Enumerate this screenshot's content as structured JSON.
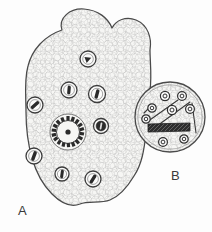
{
  "figure": {
    "background_color": "#fdfdfd",
    "ink_color": "#4a4a4a",
    "dark_ink_color": "#2b2b2b",
    "fill_color": "#f7f7f5",
    "panels": [
      {
        "id": "A",
        "label": "A",
        "label_x": 18,
        "label_y": 215,
        "shape": "lobed-oval-cross-section",
        "description": "Large lobed transverse section with parenchyma ground tissue, scattered vascular bundles and a central gear-like bundle",
        "center_bundle": {
          "name": "central-vascular-bundle",
          "cx": 68,
          "cy": 132,
          "r": 18,
          "teeth": 18,
          "core_r": 3
        },
        "bundles": [
          {
            "cx": 88,
            "cy": 59,
            "r": 8.0,
            "angle": -20,
            "kind": "wedge"
          },
          {
            "cx": 69,
            "cy": 90,
            "r": 8.0,
            "angle": 85,
            "kind": "slit"
          },
          {
            "cx": 97,
            "cy": 94,
            "r": 8.5,
            "angle": 75,
            "kind": "slit"
          },
          {
            "cx": 35,
            "cy": 105,
            "r": 8.0,
            "angle": 40,
            "kind": "slit"
          },
          {
            "cx": 101,
            "cy": 126,
            "r": 7.5,
            "angle": 95,
            "kind": "filled"
          },
          {
            "cx": 34,
            "cy": 156,
            "r": 8.0,
            "angle": 110,
            "kind": "slit"
          },
          {
            "cx": 62,
            "cy": 174,
            "r": 7.0,
            "angle": 95,
            "kind": "slit"
          },
          {
            "cx": 93,
            "cy": 179,
            "r": 8.0,
            "angle": 60,
            "kind": "slit"
          }
        ]
      },
      {
        "id": "B",
        "label": "B",
        "label_x": 171,
        "label_y": 180,
        "shape": "circular-cross-section",
        "description": "Smaller circular transverse section with vascular bundles, diagonal strands and a dark sclerenchyma bar",
        "outline": {
          "cx": 170,
          "cy": 117,
          "r": 35
        },
        "bundles": [
          {
            "cx": 165,
            "cy": 96,
            "r": 4.6
          },
          {
            "cx": 182,
            "cy": 96,
            "r": 4.4
          },
          {
            "cx": 190,
            "cy": 109,
            "r": 4.4
          },
          {
            "cx": 172,
            "cy": 110,
            "r": 4.6
          },
          {
            "cx": 152,
            "cy": 108,
            "r": 4.2
          },
          {
            "cx": 146,
            "cy": 119,
            "r": 4.2
          },
          {
            "cx": 163,
            "cy": 142,
            "r": 4.4
          },
          {
            "cx": 184,
            "cy": 139,
            "r": 4.2
          }
        ],
        "strands": [
          {
            "x1": 147,
            "y1": 122,
            "x2": 178,
            "y2": 100
          },
          {
            "x1": 150,
            "y1": 131,
            "x2": 190,
            "y2": 102
          },
          {
            "x1": 144,
            "y1": 113,
            "x2": 152,
            "y2": 105
          },
          {
            "x1": 192,
            "y1": 103,
            "x2": 196,
            "y2": 133
          }
        ],
        "dark_bar": {
          "name": "sclerenchyma-bar",
          "x": 148,
          "y": 124,
          "w": 42,
          "h": 8,
          "color": "#2e2e2e"
        }
      }
    ]
  }
}
